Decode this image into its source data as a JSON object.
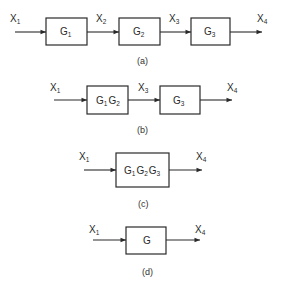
{
  "diagrams": [
    {
      "id": "a",
      "caption": "(a)",
      "signals": [
        {
          "base": "X",
          "sub": "1"
        },
        {
          "base": "X",
          "sub": "2"
        },
        {
          "base": "X",
          "sub": "3"
        },
        {
          "base": "X",
          "sub": "4"
        }
      ],
      "blocks": [
        {
          "parts": [
            {
              "base": "G",
              "sub": "1"
            }
          ]
        },
        {
          "parts": [
            {
              "base": "G",
              "sub": "2"
            }
          ]
        },
        {
          "parts": [
            {
              "base": "G",
              "sub": "3"
            }
          ]
        }
      ]
    },
    {
      "id": "b",
      "caption": "(b)",
      "signals": [
        {
          "base": "X",
          "sub": "1"
        },
        {
          "base": "X",
          "sub": "3"
        },
        {
          "base": "X",
          "sub": "4"
        }
      ],
      "blocks": [
        {
          "parts": [
            {
              "base": "G",
              "sub": "1"
            },
            {
              "base": "G",
              "sub": "2"
            }
          ]
        },
        {
          "parts": [
            {
              "base": "G",
              "sub": "3"
            }
          ]
        }
      ]
    },
    {
      "id": "c",
      "caption": "(c)",
      "signals": [
        {
          "base": "X",
          "sub": "1"
        },
        {
          "base": "X",
          "sub": "4"
        }
      ],
      "blocks": [
        {
          "parts": [
            {
              "base": "G",
              "sub": "1"
            },
            {
              "base": "G",
              "sub": "2"
            },
            {
              "base": "G",
              "sub": "3"
            }
          ]
        }
      ]
    },
    {
      "id": "d",
      "caption": "(d)",
      "signals": [
        {
          "base": "X",
          "sub": "1"
        },
        {
          "base": "X",
          "sub": "4"
        }
      ],
      "blocks": [
        {
          "parts": [
            {
              "base": "G",
              "sub": ""
            }
          ]
        }
      ]
    }
  ],
  "colors": {
    "line": "#2a2a2a",
    "background": "#ffffff"
  }
}
